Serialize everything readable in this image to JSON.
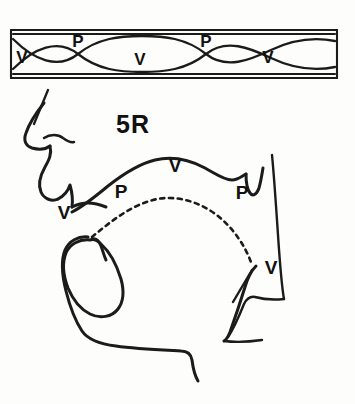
{
  "figure": {
    "caption": "5R",
    "background_color": "#fdfdfc",
    "ink_color": "#1b1b1b",
    "width": 355,
    "height": 404
  },
  "tube_panel": {
    "name": "standing-wave-tube",
    "description": "Rectangular uniform tube with two crossing sinusoidal standing-wave curves",
    "border_color": "#1b1b1b",
    "labels": [
      {
        "text": "V",
        "x": 22,
        "y": 63,
        "meaning": "velocity-maximum"
      },
      {
        "text": "P",
        "x": 78,
        "y": 47,
        "meaning": "pressure-maximum"
      },
      {
        "text": "V",
        "x": 140,
        "y": 65,
        "meaning": "velocity-maximum"
      },
      {
        "text": "P",
        "x": 206,
        "y": 47,
        "meaning": "pressure-maximum"
      },
      {
        "text": "V",
        "x": 268,
        "y": 63,
        "meaning": "velocity-maximum"
      }
    ],
    "node_count": 2,
    "antinode_count": 3
  },
  "tract_panel": {
    "name": "vocal-tract-sagittal-section",
    "description": "Mid-sagittal outline of nose, lips, tongue, jaw and pharynx with dashed standing-wave arch",
    "labels": [
      {
        "text": "V",
        "x": 64,
        "y": 219,
        "meaning": "velocity-maximum-at-lips"
      },
      {
        "text": "P",
        "x": 121,
        "y": 198,
        "meaning": "pressure-maximum-oral"
      },
      {
        "text": "V",
        "x": 175,
        "y": 172,
        "meaning": "velocity-maximum-palatal"
      },
      {
        "text": "P",
        "x": 242,
        "y": 199,
        "meaning": "pressure-maximum-velar"
      },
      {
        "text": "V",
        "x": 271,
        "y": 274,
        "meaning": "velocity-maximum-pharyngeal"
      }
    ]
  }
}
